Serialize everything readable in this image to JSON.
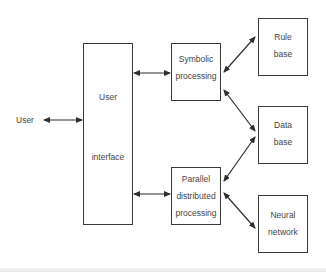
{
  "diagram": {
    "external_actor": {
      "label": "User"
    },
    "nodes": {
      "user_interface": {
        "line1": "User",
        "line2": "interface"
      },
      "symbolic_processing": {
        "line1": "Symbolic",
        "line2": "processing"
      },
      "parallel_distributed_processing": {
        "line1": "Parallel",
        "line2": "distributed",
        "line3": "processing"
      },
      "rule_base": {
        "line1": "Rule",
        "line2": "base"
      },
      "data_base": {
        "line1": "Data",
        "line2": "base"
      },
      "neural_network": {
        "line1": "Neural",
        "line2": "network"
      }
    },
    "edges": [
      {
        "from": "User",
        "to": "User interface",
        "type": "bidirectional"
      },
      {
        "from": "User interface",
        "to": "Symbolic processing",
        "type": "bidirectional"
      },
      {
        "from": "User interface",
        "to": "Parallel distributed processing",
        "type": "bidirectional"
      },
      {
        "from": "Symbolic processing",
        "to": "Rule base",
        "type": "bidirectional"
      },
      {
        "from": "Symbolic processing",
        "to": "Data base",
        "type": "bidirectional"
      },
      {
        "from": "Parallel distributed processing",
        "to": "Data base",
        "type": "bidirectional"
      },
      {
        "from": "Parallel distributed processing",
        "to": "Neural network",
        "type": "bidirectional"
      }
    ],
    "colors": {
      "stroke": "#3a3a3a",
      "text": "#444444",
      "background": "#ffffff"
    }
  }
}
